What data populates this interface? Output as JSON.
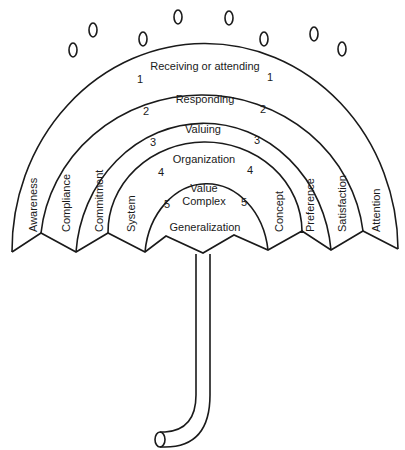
{
  "diagram": {
    "levels": [
      {
        "number": "1",
        "label": "Receiving or attending",
        "left_term": "Awareness",
        "right_term": "Attention"
      },
      {
        "number": "2",
        "label": "Responding",
        "left_term": "Compliance",
        "right_term": "Satisfaction"
      },
      {
        "number": "3",
        "label": "Valuing",
        "left_term": "Commitment",
        "right_term": "Preference"
      },
      {
        "number": "4",
        "label": "Organization",
        "left_term": "System",
        "right_term": "Concept"
      },
      {
        "number": "5",
        "label_line1": "Value",
        "label_line2": "Complex",
        "bottom_label": "Generalization"
      }
    ],
    "colors": {
      "stroke": "#1a1a1a",
      "background": "#ffffff"
    }
  }
}
